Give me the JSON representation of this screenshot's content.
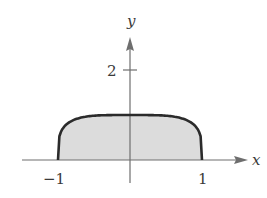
{
  "chart_data": {
    "type": "area",
    "title": "",
    "xlabel": "x",
    "ylabel": "y",
    "xlim": [
      -1.5,
      1.6
    ],
    "ylim": [
      -0.6,
      2.7
    ],
    "x_ticks": [
      {
        "value": -1,
        "label": "−1"
      },
      {
        "value": 1,
        "label": "1"
      }
    ],
    "y_ticks": [
      {
        "value": 2,
        "label": "2"
      }
    ],
    "grid": false,
    "series": [
      {
        "name": "curve",
        "description": "flat-topped curve from (-1,0) rising to height 1, flat near x=0, falling to (1,0); region under curve shaded",
        "x": [
          -1,
          -0.95,
          -0.9,
          -0.8,
          -0.7,
          -0.6,
          -0.5,
          -0.4,
          -0.3,
          -0.2,
          -0.1,
          0,
          0.1,
          0.2,
          0.3,
          0.4,
          0.5,
          0.6,
          0.7,
          0.8,
          0.9,
          0.95,
          1
        ],
        "y": [
          0,
          0.57,
          0.71,
          0.86,
          0.94,
          0.97,
          0.99,
          1.0,
          1.0,
          1.0,
          1.0,
          1.0,
          1.0,
          1.0,
          1.0,
          1.0,
          0.99,
          0.97,
          0.94,
          0.86,
          0.71,
          0.57,
          0
        ]
      }
    ],
    "fill": "#dcdcdc",
    "line_color": "#2b2b2b",
    "axis_color": "#6e6e6e"
  }
}
